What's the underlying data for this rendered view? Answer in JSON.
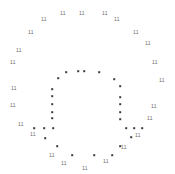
{
  "chart_data": {
    "type": "scatter",
    "title": "",
    "subtitle": "",
    "xlabel": "",
    "ylabel": "",
    "xlim": [
      0,
      175
    ],
    "ylim": [
      0,
      174
    ],
    "grid": false,
    "legend": "none",
    "axes_visible": false,
    "background_color": "#ffffff",
    "series": [
      {
        "name": "outer-ring-labels",
        "marker": "text",
        "marker_text": "11",
        "color": "#6b6b6b",
        "points": [
          {
            "x": 63,
            "y": 13,
            "label": "11"
          },
          {
            "x": 82,
            "y": 13,
            "label": "11"
          },
          {
            "x": 105,
            "y": 13,
            "label": "11"
          },
          {
            "x": 44,
            "y": 19,
            "label": "11"
          },
          {
            "x": 117,
            "y": 19,
            "label": "11"
          },
          {
            "x": 31,
            "y": 32,
            "label": "11"
          },
          {
            "x": 136,
            "y": 32,
            "label": "11"
          },
          {
            "x": 148,
            "y": 43,
            "label": "11"
          },
          {
            "x": 19,
            "y": 50,
            "label": "11"
          },
          {
            "x": 13,
            "y": 62,
            "label": "11"
          },
          {
            "x": 155,
            "y": 62,
            "label": "11"
          },
          {
            "x": 162,
            "y": 80,
            "label": "11"
          },
          {
            "x": 14,
            "y": 88,
            "label": "11"
          },
          {
            "x": 13,
            "y": 105,
            "label": "11"
          },
          {
            "x": 154,
            "y": 106,
            "label": "11"
          },
          {
            "x": 150,
            "y": 118,
            "label": "11"
          },
          {
            "x": 21,
            "y": 124,
            "label": "11"
          },
          {
            "x": 33,
            "y": 134,
            "label": "11"
          },
          {
            "x": 138,
            "y": 135,
            "label": "11"
          },
          {
            "x": 52,
            "y": 155,
            "label": "11"
          },
          {
            "x": 124,
            "y": 147,
            "label": "11"
          },
          {
            "x": 64,
            "y": 163,
            "label": "11"
          },
          {
            "x": 106,
            "y": 161,
            "label": "11"
          },
          {
            "x": 85,
            "y": 168,
            "label": "11"
          }
        ]
      },
      {
        "name": "inner-ring-dots",
        "marker": "square",
        "color": "#3a3a3a",
        "points": [
          {
            "x": 66,
            "y": 72
          },
          {
            "x": 78,
            "y": 71
          },
          {
            "x": 84,
            "y": 71
          },
          {
            "x": 99,
            "y": 72
          },
          {
            "x": 58,
            "y": 78
          },
          {
            "x": 114,
            "y": 79
          },
          {
            "x": 52,
            "y": 89
          },
          {
            "x": 120,
            "y": 86
          },
          {
            "x": 52,
            "y": 96
          },
          {
            "x": 120,
            "y": 97
          },
          {
            "x": 52,
            "y": 104
          },
          {
            "x": 120,
            "y": 104
          },
          {
            "x": 52,
            "y": 112
          },
          {
            "x": 120,
            "y": 112
          },
          {
            "x": 52,
            "y": 118
          },
          {
            "x": 120,
            "y": 119
          },
          {
            "x": 34,
            "y": 128
          },
          {
            "x": 44,
            "y": 128
          },
          {
            "x": 53,
            "y": 128
          },
          {
            "x": 126,
            "y": 128
          },
          {
            "x": 134,
            "y": 128
          },
          {
            "x": 142,
            "y": 128
          },
          {
            "x": 45,
            "y": 138
          },
          {
            "x": 131,
            "y": 137
          },
          {
            "x": 57,
            "y": 146
          },
          {
            "x": 120,
            "y": 146
          },
          {
            "x": 72,
            "y": 155
          },
          {
            "x": 94,
            "y": 155
          },
          {
            "x": 112,
            "y": 155
          }
        ]
      }
    ]
  }
}
